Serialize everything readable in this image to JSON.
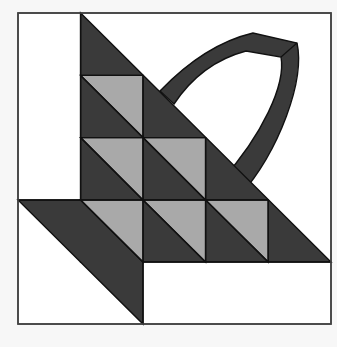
{
  "colors": {
    "background": "#f7f7f7",
    "block": "#ffffff",
    "dark": "#3a3a3a",
    "light": "#a9a9a9",
    "outline": "#1e1e1e"
  },
  "block": {
    "x": 18,
    "y": 13,
    "size": 313,
    "grid": 5
  },
  "pieces": {
    "basket_body": "dark and light half-square triangles forming the basket",
    "basket_foot": "dark parallelogram foot at lower left",
    "handle": "dark curved handle arcing over the basket"
  }
}
